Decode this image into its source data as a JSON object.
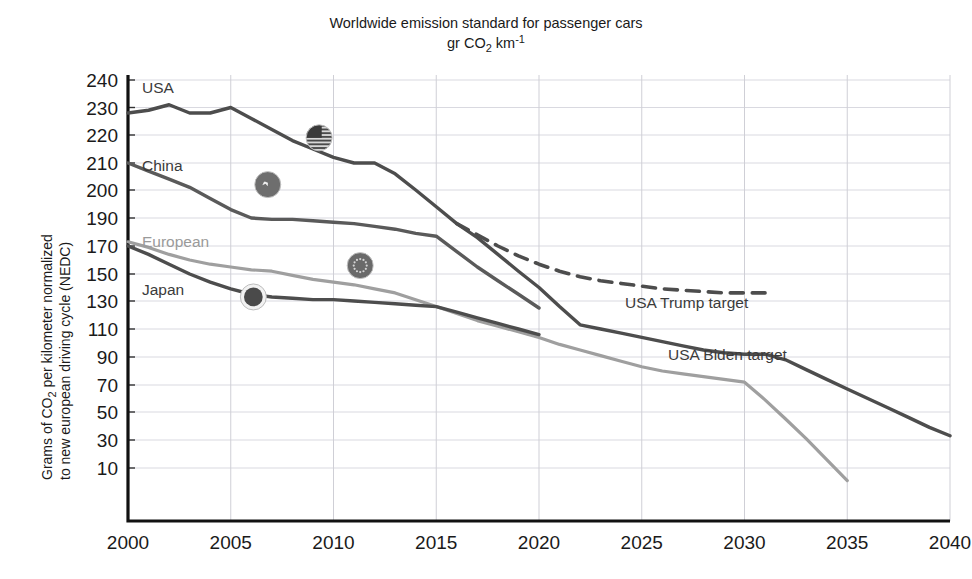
{
  "chart_data": {
    "type": "line",
    "title": "Worldwide emission standard for passenger cars",
    "subtitle": "gr CO2 km-1",
    "title_line1": "Worldwide emission standard for passenger cars",
    "title_line2_pre": "gr CO",
    "title_line2_sub": "2",
    "title_line2_mid": " km",
    "title_line2_sup": "-1",
    "ylabel_line1_pre": "Grams of CO",
    "ylabel_line1_sub": "2",
    "ylabel_line1_post": " per kilometer normalized",
    "ylabel_line2": "to new european driving cycle (NEDC)",
    "ylabel": "Grams of CO2 per kilometer normalized to new european driving cycle (NEDC)",
    "xlabel": "",
    "xlim": [
      2000,
      2040
    ],
    "ylim": [
      0,
      250
    ],
    "grid": true,
    "legend_position": "inline-labels",
    "xticks": [
      2000,
      2005,
      2010,
      2015,
      2020,
      2025,
      2030,
      2035,
      2040
    ],
    "yticks": [
      240,
      230,
      220,
      210,
      200,
      190,
      170,
      150,
      130,
      110,
      90,
      70,
      50,
      30,
      10
    ],
    "series": [
      {
        "name": "USA",
        "color": "#4d4d4d",
        "style": "solid",
        "label": "USA",
        "points": [
          [
            2000,
            228
          ],
          [
            2001,
            229
          ],
          [
            2002,
            231
          ],
          [
            2003,
            228
          ],
          [
            2004,
            228
          ],
          [
            2005,
            230
          ],
          [
            2006,
            226
          ],
          [
            2007,
            222
          ],
          [
            2008,
            218
          ],
          [
            2009,
            215
          ],
          [
            2010,
            212
          ],
          [
            2011,
            210
          ],
          [
            2012,
            210
          ],
          [
            2013,
            206
          ],
          [
            2014,
            200
          ],
          [
            2015,
            194
          ],
          [
            2016,
            186
          ],
          [
            2017,
            176
          ],
          [
            2018,
            164
          ],
          [
            2019,
            152
          ],
          [
            2020,
            140
          ],
          [
            2021,
            126
          ],
          [
            2022,
            113
          ],
          [
            2023,
            110
          ],
          [
            2024,
            107
          ],
          [
            2025,
            104
          ],
          [
            2026,
            101
          ],
          [
            2027,
            98
          ],
          [
            2028,
            95
          ],
          [
            2029,
            93
          ],
          [
            2030,
            92
          ],
          [
            2031,
            92
          ],
          [
            2032,
            88
          ],
          [
            2033,
            81
          ],
          [
            2034,
            74
          ],
          [
            2035,
            67
          ],
          [
            2036,
            60
          ],
          [
            2037,
            53
          ],
          [
            2038,
            46
          ],
          [
            2039,
            39
          ],
          [
            2040,
            33
          ]
        ]
      },
      {
        "name": "China",
        "color": "#5a5a5a",
        "style": "solid",
        "label": "China",
        "points": [
          [
            2000,
            210
          ],
          [
            2001,
            207
          ],
          [
            2002,
            204
          ],
          [
            2003,
            201
          ],
          [
            2004,
            197
          ],
          [
            2005,
            193
          ],
          [
            2006,
            190
          ],
          [
            2007,
            189
          ],
          [
            2008,
            189
          ],
          [
            2009,
            188
          ],
          [
            2010,
            187
          ],
          [
            2011,
            186
          ],
          [
            2012,
            184
          ],
          [
            2013,
            182
          ],
          [
            2014,
            179
          ],
          [
            2015,
            177
          ],
          [
            2016,
            166
          ],
          [
            2017,
            155
          ],
          [
            2018,
            145
          ],
          [
            2019,
            135
          ],
          [
            2020,
            125
          ]
        ]
      },
      {
        "name": "European",
        "color": "#9f9f9f",
        "style": "solid",
        "label": "European",
        "points": [
          [
            2000,
            173
          ],
          [
            2001,
            169
          ],
          [
            2002,
            164
          ],
          [
            2003,
            160
          ],
          [
            2004,
            157
          ],
          [
            2005,
            155
          ],
          [
            2006,
            153
          ],
          [
            2007,
            152
          ],
          [
            2008,
            149
          ],
          [
            2009,
            146
          ],
          [
            2010,
            144
          ],
          [
            2011,
            142
          ],
          [
            2012,
            139
          ],
          [
            2013,
            136
          ],
          [
            2014,
            131
          ],
          [
            2015,
            126
          ],
          [
            2016,
            121
          ],
          [
            2017,
            116
          ],
          [
            2018,
            112
          ],
          [
            2019,
            108
          ],
          [
            2020,
            104
          ],
          [
            2021,
            99
          ],
          [
            2022,
            95
          ],
          [
            2023,
            91
          ],
          [
            2024,
            87
          ],
          [
            2025,
            83
          ],
          [
            2026,
            80
          ],
          [
            2027,
            78
          ],
          [
            2028,
            76
          ],
          [
            2029,
            74
          ],
          [
            2030,
            72
          ],
          [
            2031,
            59
          ],
          [
            2032,
            45
          ],
          [
            2033,
            31
          ],
          [
            2034,
            16
          ],
          [
            2035,
            1
          ]
        ]
      },
      {
        "name": "Japan",
        "color": "#4d4d4d",
        "style": "solid",
        "label": "Japan",
        "points": [
          [
            2000,
            170
          ],
          [
            2001,
            164
          ],
          [
            2002,
            157
          ],
          [
            2003,
            150
          ],
          [
            2004,
            144
          ],
          [
            2005,
            139
          ],
          [
            2006,
            135
          ],
          [
            2007,
            133
          ],
          [
            2008,
            132
          ],
          [
            2009,
            131
          ],
          [
            2010,
            131
          ],
          [
            2011,
            130
          ],
          [
            2012,
            129
          ],
          [
            2013,
            128
          ],
          [
            2014,
            127
          ],
          [
            2015,
            126
          ],
          [
            2016,
            122
          ],
          [
            2017,
            118
          ],
          [
            2018,
            114
          ],
          [
            2019,
            110
          ],
          [
            2020,
            106
          ]
        ]
      },
      {
        "name": "USA Trump target",
        "color": "#4d4d4d",
        "style": "dashed",
        "label": "USA Trump target",
        "points": [
          [
            2016,
            186
          ],
          [
            2017,
            178
          ],
          [
            2018,
            170
          ],
          [
            2019,
            163
          ],
          [
            2020,
            157
          ],
          [
            2021,
            152
          ],
          [
            2022,
            148
          ],
          [
            2023,
            145
          ],
          [
            2024,
            143
          ],
          [
            2025,
            141
          ],
          [
            2026,
            139
          ],
          [
            2027,
            138
          ],
          [
            2028,
            137
          ],
          [
            2029,
            136
          ],
          [
            2030,
            136
          ],
          [
            2031,
            136
          ]
        ]
      }
    ],
    "annotations": [
      {
        "text": "USA Trump target",
        "x": 2026,
        "y": 148
      },
      {
        "text": "USA Biden target",
        "x": 2026.5,
        "y": 118
      }
    ],
    "flag_markers": [
      {
        "name": "usa-flag",
        "x": 2009.3,
        "y": 219
      },
      {
        "name": "china-flag",
        "x": 2006.8,
        "y": 202
      },
      {
        "name": "eu-flag",
        "x": 2011.3,
        "y": 156
      },
      {
        "name": "japan-flag",
        "x": 2006.1,
        "y": 133
      }
    ]
  }
}
